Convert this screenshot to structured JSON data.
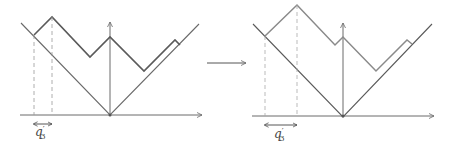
{
  "colors": {
    "left_path": "#5a5a5a",
    "right_path": "#8a8a8a",
    "axes": "#6a6a6a",
    "dashed": "#999999",
    "label": "#444444"
  },
  "left_panel": {
    "label": {
      "base": "q",
      "prime": "′",
      "sub": "3"
    },
    "x_axis": {
      "x1": 20,
      "y1": 115,
      "x2": 202,
      "y2": 115
    },
    "y_axis": {
      "x1": 110,
      "y1": 116,
      "x2": 110,
      "y2": 22
    },
    "v_shape": "21,23 110,115 199,24",
    "upper_path": "34,35 52,17 90,57 110,37 144,71 175,40 180,45",
    "dashed_lines": [
      {
        "x": 34,
        "y1": 35,
        "y2": 115
      },
      {
        "x": 52,
        "y1": 17,
        "y2": 115
      }
    ],
    "measure": {
      "x1": 34,
      "x2": 52,
      "y": 124
    }
  },
  "transition_arrow": {
    "x1": 207,
    "x2": 246,
    "y": 63
  },
  "right_panel": {
    "label": {
      "base": "q",
      "prime": "′",
      "sub": "3"
    },
    "x_axis": {
      "x1": 252,
      "y1": 116,
      "x2": 434,
      "y2": 116
    },
    "y_axis": {
      "x1": 343,
      "y1": 117,
      "x2": 343,
      "y2": 23
    },
    "v_shape": "253,24 343,117 432,24",
    "upper_path": "265,36 297,5 335,45 343,37 376,71 407,40 412,44",
    "dashed_lines": [
      {
        "x": 265,
        "y1": 36,
        "y2": 116
      },
      {
        "x": 297,
        "y1": 5,
        "y2": 116
      }
    ],
    "measure": {
      "x1": 265,
      "x2": 297,
      "y": 125
    }
  }
}
